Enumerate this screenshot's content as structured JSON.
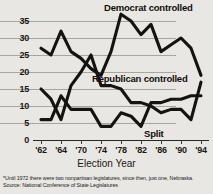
{
  "chart_data": {
    "type": "line",
    "title": "",
    "xlabel": "Election Year",
    "ylabel": "",
    "ylim": [
      0,
      35
    ],
    "yticks": [
      0,
      5,
      10,
      15,
      20,
      25,
      30,
      35
    ],
    "xticks": [
      "'62",
      "'64",
      "'70",
      "'74",
      "'78",
      "'82",
      "'86",
      "'90",
      "'94"
    ],
    "grid": true,
    "legend_position": "inline-annotations",
    "x": [
      1962,
      1964,
      1966,
      1968,
      1970,
      1972,
      1974,
      1976,
      1978,
      1980,
      1982,
      1984,
      1986,
      1988,
      1990,
      1992,
      1994
    ],
    "series": [
      {
        "name": "Democrat controlled",
        "values": [
          27,
          25,
          32,
          26,
          24,
          21,
          19,
          26,
          37,
          35,
          31,
          34,
          26,
          28,
          30,
          27,
          19
        ]
      },
      {
        "name": "Republican controlled",
        "values": [
          15,
          12,
          6,
          16,
          20,
          25,
          16,
          16,
          15,
          11,
          11,
          10,
          8,
          9,
          9,
          6,
          17
        ]
      },
      {
        "name": "Split",
        "values": [
          6,
          6,
          13,
          9,
          9,
          9,
          4,
          4,
          8,
          7,
          4,
          11,
          11,
          12,
          12,
          13,
          13
        ]
      }
    ],
    "annotations": [
      "Democrat controlled",
      "Republican controlled",
      "Split"
    ],
    "footnotes": [
      "*Until 1972 there were two nonpartisan legislatures, since then, just one, Nebraska.",
      "Source: National Conference of State Legislatures"
    ],
    "colors": {
      "line": "#15130f",
      "grid": "#a9a49c",
      "background": "#e9e7e3"
    }
  }
}
